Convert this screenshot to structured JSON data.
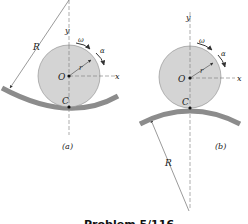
{
  "figure": {
    "caption": "Problem 5/116",
    "panels": [
      {
        "id": "a",
        "label": "(a)",
        "description": "Disk rolling inside a concave circular track",
        "labels": {
          "R": "R",
          "y": "y",
          "x": "x",
          "omega": "ω",
          "alpha": "α",
          "r": "r",
          "O": "O",
          "C": "C"
        }
      },
      {
        "id": "b",
        "label": "(b)",
        "description": "Disk rolling on top of a convex circular track",
        "labels": {
          "R": "R",
          "y": "y",
          "x": "x",
          "omega": "ω",
          "alpha": "α",
          "r": "r",
          "O": "O",
          "C": "C"
        }
      }
    ]
  },
  "colors": {
    "disk_fill": "#d4d4d4",
    "disk_stroke": "#8a8a8a",
    "track": "#8c8c8c",
    "track_edge": "#6e6e6e",
    "line": "#555555",
    "text": "#222222"
  }
}
